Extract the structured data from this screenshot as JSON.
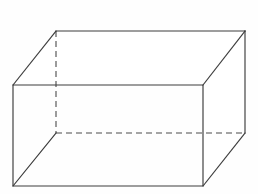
{
  "figure": {
    "shape_name": "rectangular-prism",
    "projection": "oblique",
    "canvas": {
      "width": 258,
      "height": 194,
      "background": "#fefefe"
    },
    "style": {
      "visible_edge_color": "#3c3c3c",
      "hidden_edge_color": "#4a4a4a",
      "face_fill_color": "#ffffff",
      "visible_edge_width": 1.15,
      "hidden_edge_width": 1.1,
      "hidden_dash_pattern": "6 4"
    },
    "vertices": {
      "front_top_left": {
        "x": 13,
        "y": 85
      },
      "front_top_right": {
        "x": 203,
        "y": 85
      },
      "front_bottom_right": {
        "x": 203,
        "y": 186
      },
      "front_bottom_left": {
        "x": 13,
        "y": 186
      },
      "back_top_left": {
        "x": 56,
        "y": 31
      },
      "back_top_right": {
        "x": 245,
        "y": 31
      },
      "back_bottom_right": {
        "x": 245,
        "y": 133
      },
      "back_bottom_left": {
        "x": 56,
        "y": 133
      }
    },
    "paths": {
      "front_face": "M 13 85 L 203 85 L 203 186 L 13 186 Z",
      "top_face": "M 13 85 L 56 31 L 245 31 L 203 85 Z",
      "right_face": "M 203 85 L 245 31 L 245 133 L 203 186 Z",
      "front_face_outline": "M 13 85 L 203 85 L 203 186 L 13 186 Z",
      "top_back_edge": "M 56 31 L 245 31",
      "top_left_diagonal": "M 13 85 L 56 31",
      "top_right_diagonal": "M 203 85 L 245 31",
      "back_right_vertical": "M 245 31 L 245 133",
      "bottom_right_diagonal": "M 203 186 L 245 133",
      "bottom_left_diagonal": "M 13 186 L 56 133",
      "hidden_back_left_vertical": "M 56 31 L 56 133",
      "hidden_back_bottom_edge": "M 56 133 L 245 133"
    },
    "edges": [
      {
        "name": "front-top-edge",
        "hidden": false
      },
      {
        "name": "front-right-edge",
        "hidden": false
      },
      {
        "name": "front-bottom-edge",
        "hidden": false
      },
      {
        "name": "front-left-edge",
        "hidden": false
      },
      {
        "name": "back-top-edge",
        "hidden": false
      },
      {
        "name": "back-right-edge",
        "hidden": false
      },
      {
        "name": "top-left-connector",
        "hidden": false
      },
      {
        "name": "top-right-connector",
        "hidden": false
      },
      {
        "name": "bottom-right-connector",
        "hidden": false
      },
      {
        "name": "bottom-left-connector",
        "hidden": false
      },
      {
        "name": "back-left-edge",
        "hidden": true
      },
      {
        "name": "back-bottom-edge",
        "hidden": true
      }
    ]
  }
}
